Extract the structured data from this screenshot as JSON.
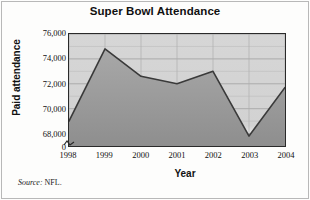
{
  "chart_data": {
    "type": "area",
    "title": "Super Bowl Attendance",
    "xlabel": "Year",
    "ylabel": "Paid attendance",
    "categories": [
      "1998",
      "1999",
      "2000",
      "2001",
      "2002",
      "2003",
      "2004"
    ],
    "values": [
      69000,
      74800,
      72600,
      72000,
      73000,
      67800,
      71700
    ],
    "x": [
      1998,
      1999,
      2000,
      2001,
      2002,
      2003,
      2004
    ],
    "ylim": [
      67000,
      76000
    ],
    "yticks": [
      76000,
      74000,
      72000,
      70000,
      68000
    ],
    "ytick_labels": [
      "76,000",
      "74,000",
      "72,000",
      "70,000",
      "68,000"
    ],
    "xtick_labels": [
      "1998",
      "1999",
      "2000",
      "2001",
      "2002",
      "2003",
      "2004"
    ],
    "origin_label": "0",
    "axis_break": true,
    "grid": true,
    "grid_minor_step": 1000,
    "legend": null,
    "series": [
      {
        "name": "Paid attendance",
        "values": [
          69000,
          74800,
          72600,
          72000,
          73000,
          67800,
          71700
        ]
      }
    ],
    "colors": {
      "area_fill": "#9a9a9a",
      "line": "#3a3a3a",
      "plot_background": "#d9d9d9",
      "grid": "#b5b5b5",
      "axis": "#2a2a2a",
      "text": "#101010"
    }
  },
  "source": {
    "label": "Source:",
    "value": "NFL."
  }
}
